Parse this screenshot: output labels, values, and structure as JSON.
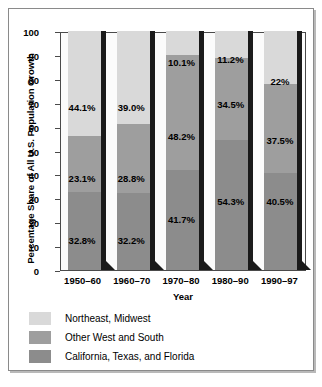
{
  "chart_data": {
    "type": "bar",
    "subtype": "stacked-bar-100-percent",
    "title": "",
    "xlabel": "Year",
    "ylabel": "Percentage Share of All U.S. Population Growth",
    "ylim": [
      0,
      100
    ],
    "yticks": [
      0,
      10,
      20,
      30,
      40,
      50,
      60,
      70,
      80,
      90,
      100
    ],
    "grid": false,
    "legend_position": "below",
    "categories": [
      "1950–60",
      "1960–70",
      "1970–80",
      "1980–90",
      "1990–97"
    ],
    "series": [
      {
        "name": "Northeast, Midwest",
        "color": "#d9d9d9",
        "values": [
          44.1,
          39.0,
          10.1,
          11.2,
          22.0
        ],
        "labels": [
          "44.1%",
          "39.0%",
          "10.1%",
          "11.2%",
          "22%"
        ]
      },
      {
        "name": "Other West and South",
        "color": "#9e9e9e",
        "values": [
          23.1,
          28.8,
          48.2,
          34.5,
          37.5
        ],
        "labels": [
          "23.1%",
          "28.8%",
          "48.2%",
          "34.5%",
          "37.5%"
        ]
      },
      {
        "name": "California, Texas, and Florida",
        "color": "#8c8c8c",
        "values": [
          32.8,
          32.2,
          41.7,
          54.3,
          40.5
        ],
        "labels": [
          "32.8%",
          "32.2%",
          "41.7%",
          "54.3%",
          "40.5%"
        ]
      }
    ],
    "stack_order_bottom_to_top": [
      "California, Texas, and Florida",
      "Other West and South",
      "Northeast, Midwest"
    ],
    "label_inside_segment": {
      "1950–60": {
        "top": "44.1%",
        "middle": "23.1%",
        "bottom": "32.8%"
      },
      "1960–70": {
        "top": "39.0%",
        "middle": "28.8%",
        "bottom": "32.2%"
      },
      "1970–80": {
        "top": "10.1%",
        "middle": "48.2%",
        "bottom": "41.7%"
      },
      "1980–90": {
        "top": "11.2%",
        "middle": "34.5%",
        "bottom": "54.3%"
      },
      "1990–97": {
        "top": "22%",
        "middle": "37.5%",
        "bottom": "40.5%"
      }
    }
  },
  "legend": {
    "items": [
      {
        "label": "Northeast, Midwest",
        "color": "#d9d9d9"
      },
      {
        "label": "Other West and South",
        "color": "#9e9e9e"
      },
      {
        "label": "California, Texas, and Florida",
        "color": "#8c8c8c"
      }
    ]
  },
  "colors": {
    "plot_border": "#4a4a4a",
    "outer_border": "#8a8a8a",
    "bar_shadow": "#1a1a1a",
    "background": "#ffffff",
    "plot_background": "#fbfbfb"
  }
}
